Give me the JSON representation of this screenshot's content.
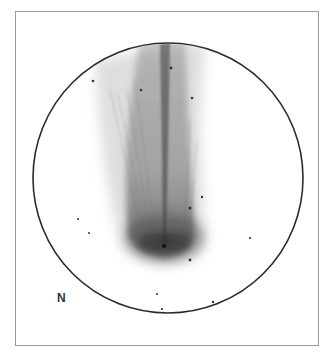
{
  "sketch": {
    "subject": "comet",
    "orientation_label": "N",
    "field_of_view": {
      "center": [
        168,
        178
      ],
      "radius": 135,
      "stroke_color": "#2a2a2a"
    },
    "frame": {
      "border_color": "#9a9a9a"
    },
    "nucleus": [
      164,
      246
    ],
    "stars": [
      {
        "x": 93,
        "y": 81,
        "r": 1.3
      },
      {
        "x": 141,
        "y": 90,
        "r": 1.3
      },
      {
        "x": 171,
        "y": 68,
        "r": 1.4
      },
      {
        "x": 192,
        "y": 98,
        "r": 1.3
      },
      {
        "x": 202,
        "y": 197,
        "r": 1.2
      },
      {
        "x": 190,
        "y": 208,
        "r": 1.5
      },
      {
        "x": 78,
        "y": 219,
        "r": 1.0
      },
      {
        "x": 89,
        "y": 233,
        "r": 1.0
      },
      {
        "x": 250,
        "y": 238,
        "r": 1.1
      },
      {
        "x": 190,
        "y": 260,
        "r": 1.4
      },
      {
        "x": 157,
        "y": 294,
        "r": 1.0
      },
      {
        "x": 162,
        "y": 309,
        "r": 1.1
      },
      {
        "x": 213,
        "y": 302,
        "r": 1.2
      }
    ]
  }
}
